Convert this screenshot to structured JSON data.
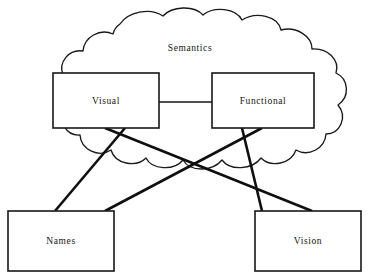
{
  "diagram": {
    "title": "Semantics",
    "type": "node-link-cloud-diagram",
    "canvas": {
      "width": 370,
      "height": 277,
      "background": "#ffffff"
    },
    "colors": {
      "stroke": "#171717",
      "cloud_stroke": "#1a1a1a",
      "link": "#0f0f0f",
      "fill": "#ffffff",
      "text": "#141414"
    },
    "cloud": {
      "name": "semantics-cloud",
      "label": "Semantics",
      "label_x": 190,
      "label_y": 49,
      "bounds": {
        "x": 27,
        "y": 10,
        "width": 318,
        "height": 176
      }
    },
    "nodes": [
      {
        "id": "visual",
        "label": "Visual",
        "x": 53,
        "y": 73,
        "width": 106,
        "height": 55,
        "inside_cloud": true
      },
      {
        "id": "functional",
        "label": "Functional",
        "x": 212,
        "y": 73,
        "width": 102,
        "height": 55,
        "inside_cloud": true
      },
      {
        "id": "names",
        "label": "Names",
        "x": 8,
        "y": 211,
        "width": 106,
        "height": 60,
        "inside_cloud": false
      },
      {
        "id": "vision",
        "label": "Vision",
        "x": 255,
        "y": 211,
        "width": 106,
        "height": 60,
        "inside_cloud": false
      }
    ],
    "links": [
      {
        "id": "visual-functional",
        "from": "visual",
        "to": "functional",
        "weight": "thin",
        "x1": 159,
        "y1": 102,
        "x2": 212,
        "y2": 102
      },
      {
        "id": "visual-names",
        "from": "visual",
        "to": "names",
        "weight": "thick",
        "x1": 125,
        "y1": 128,
        "x2": 55,
        "y2": 211
      },
      {
        "id": "visual-vision",
        "from": "visual",
        "to": "vision",
        "weight": "thick",
        "x1": 105,
        "y1": 128,
        "x2": 312,
        "y2": 211
      },
      {
        "id": "functional-names",
        "from": "functional",
        "to": "names",
        "weight": "thick",
        "x1": 262,
        "y1": 128,
        "x2": 105,
        "y2": 211
      },
      {
        "id": "functional-vision",
        "from": "functional",
        "to": "vision",
        "weight": "thick",
        "x1": 242,
        "y1": 128,
        "x2": 262,
        "y2": 211
      }
    ]
  }
}
